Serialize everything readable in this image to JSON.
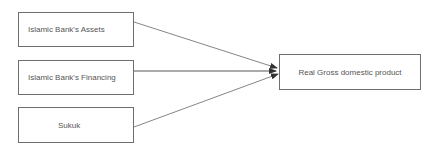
{
  "diagram": {
    "sources": [
      {
        "label": "Islamic Bank's Assets"
      },
      {
        "label": "Islamic Bank's Financing"
      },
      {
        "label": "Sukuk"
      }
    ],
    "target": {
      "label": "Real Gross domestic product"
    },
    "edges": [
      {
        "from": "Islamic Bank's Assets",
        "to": "Real Gross domestic product"
      },
      {
        "from": "Islamic Bank's Financing",
        "to": "Real Gross domestic product"
      },
      {
        "from": "Sukuk",
        "to": "Real Gross domestic product"
      }
    ],
    "colors": {
      "border": "#6e6e6e",
      "text": "#555555",
      "arrow": "#444444"
    }
  }
}
